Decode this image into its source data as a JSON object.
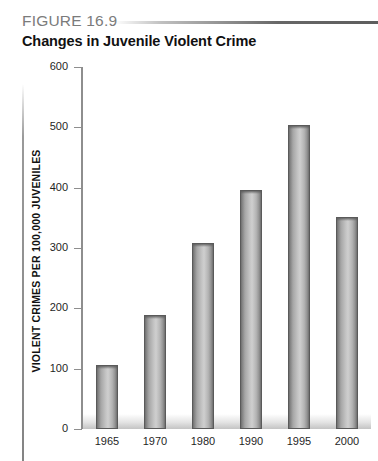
{
  "figure": {
    "label": "FIGURE 16.9",
    "title": "Changes in Juvenile Violent Crime"
  },
  "chart_data": {
    "type": "bar",
    "title": "Changes in Juvenile Violent Crime",
    "xlabel": "",
    "ylabel": "VIOLENT CRIMES PER 100,000 JUVENILES",
    "categories": [
      "1965",
      "1970",
      "1980",
      "1990",
      "1995",
      "2000"
    ],
    "values": [
      106,
      189,
      309,
      396,
      504,
      351
    ],
    "ylim": [
      0,
      600
    ],
    "yticks": [
      0,
      100,
      200,
      300,
      400,
      500,
      600
    ],
    "ytick_labels": [
      "0",
      "100",
      "200",
      "300",
      "400",
      "500",
      "600"
    ],
    "grid": false,
    "legend": null,
    "bar_color": "#b4b4b4",
    "bar_edge_color": "#5a5a5a",
    "axis_color": "#8e8e8e"
  }
}
